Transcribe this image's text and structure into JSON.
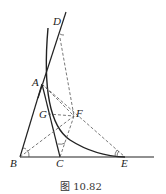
{
  "figure": {
    "caption": "图 10.82",
    "points": {
      "A": {
        "label": "A",
        "x": 42,
        "y": 84
      },
      "B": {
        "label": "B",
        "x": 20,
        "y": 157
      },
      "C": {
        "label": "C",
        "x": 60,
        "y": 157
      },
      "D": {
        "label": "D",
        "x": 63,
        "y": 22
      },
      "E": {
        "label": "E",
        "x": 125,
        "y": 157
      },
      "F": {
        "label": "F",
        "x": 74,
        "y": 116
      },
      "G": {
        "label": "G",
        "x": 48,
        "y": 114
      }
    },
    "colors": {
      "line": "#222222",
      "dashed": "#555555"
    }
  }
}
